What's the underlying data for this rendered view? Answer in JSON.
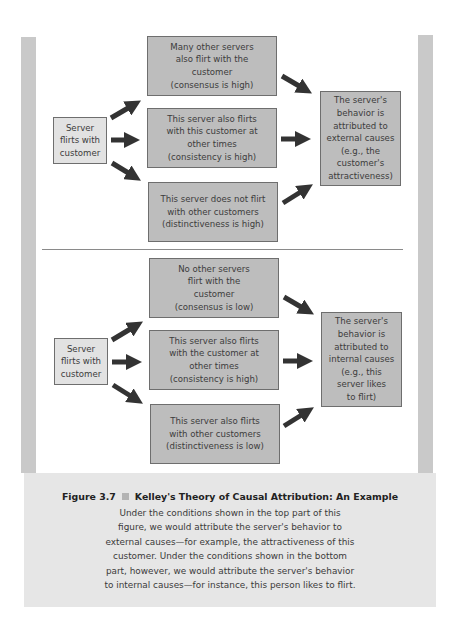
{
  "figure": {
    "number": "Figure 3.7",
    "title": "Kelley's Theory of Causal Attribution: An Example",
    "caption": "Under the conditions shown in the top part of this\nfigure, we would attribute the server's behavior to\nexternal causes—for example, the attractiveness of this\ncustomer. Under the conditions shown in the bottom\npart, however, we would attribute the server's behavior\nto internal causes—for instance, this person likes to flirt."
  },
  "colors": {
    "box_fill": "#bdbdbd",
    "source_fill": "#e2e2e2",
    "arrow": "#333333",
    "frame": "#c9c9c9",
    "caption_bg": "#e6e6e6"
  },
  "top_diagram": {
    "source": "Server\nflirts with\ncustomer",
    "conditions": [
      "Many other servers\nalso flirt with the\ncustomer\n(consensus is high)",
      "This server also flirts\nwith this customer at\nother times\n(consistency is high)",
      "This server does not flirt\nwith other customers\n(distinctiveness is high)"
    ],
    "result": "The server's\nbehavior is\nattributed to\nexternal causes\n(e.g., the\ncustomer's\nattractiveness)"
  },
  "bottom_diagram": {
    "source": "Server\nflirts with\ncustomer",
    "conditions": [
      "No other servers\nflirt with the\ncustomer\n(consensus is low)",
      "This server also flirts\nwith the customer at\nother times\n(consistency is high)",
      "This server also flirts\nwith other customers\n(distinctiveness is low)"
    ],
    "result": "The server's\nbehavior is\nattributed to\ninternal causes\n(e.g., this\nserver likes\nto flirt)"
  }
}
